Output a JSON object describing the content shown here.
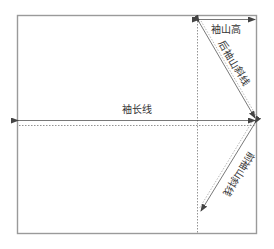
{
  "diagram": {
    "type": "sleeve-pattern-draft",
    "labels": {
      "sleeve_cap_height": "袖山高",
      "back_cap_slope": "后袖山斜线",
      "sleeve_length": "袖长线",
      "front_cap_slope": "前袖山斜线"
    },
    "colors": {
      "frame": "#999999",
      "line": "#555555",
      "text": "#333333",
      "background": "#ffffff"
    }
  }
}
